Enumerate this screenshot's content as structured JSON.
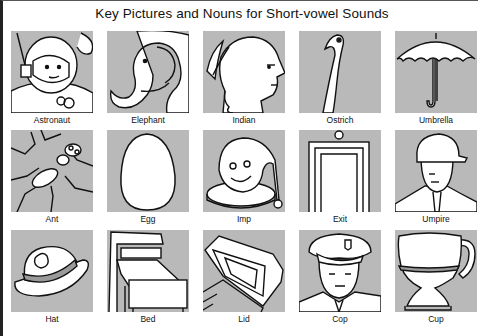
{
  "title": "Key Pictures and Nouns for Short-vowel Sounds",
  "rows": [
    [
      {
        "noun": "Astronaut",
        "icon": "astronaut-icon"
      },
      {
        "noun": "Elephant",
        "icon": "elephant-icon"
      },
      {
        "noun": "Indian",
        "icon": "indian-icon"
      },
      {
        "noun": "Ostrich",
        "icon": "ostrich-icon"
      },
      {
        "noun": "Umbrella",
        "icon": "umbrella-icon"
      }
    ],
    [
      {
        "noun": "Ant",
        "icon": "ant-icon"
      },
      {
        "noun": "Egg",
        "icon": "egg-icon"
      },
      {
        "noun": "Imp",
        "icon": "imp-icon"
      },
      {
        "noun": "Exit",
        "icon": "exit-door-icon"
      },
      {
        "noun": "Umpire",
        "icon": "umpire-icon"
      }
    ],
    [
      {
        "noun": "Hat",
        "icon": "hat-icon"
      },
      {
        "noun": "Bed",
        "icon": "bed-icon"
      },
      {
        "noun": "Lid",
        "icon": "lid-icon"
      },
      {
        "noun": "Cop",
        "icon": "cop-icon"
      },
      {
        "noun": "Cup",
        "icon": "cup-icon"
      }
    ]
  ],
  "colors": {
    "panel": "#b9b9b9",
    "ink": "#111111",
    "paper": "#ffffff"
  }
}
